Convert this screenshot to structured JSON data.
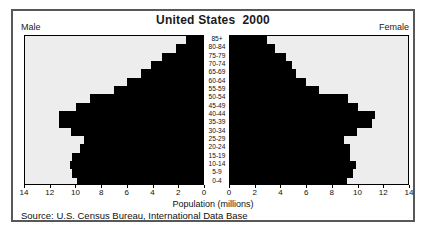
{
  "title": "United States  2000",
  "left_label": "Male",
  "right_label": "Female",
  "xlabel": "Population (millions)",
  "source": "Source: U.S. Census Bureau, International Data Base",
  "chart_data": {
    "type": "bar",
    "subtype": "population-pyramid",
    "title": "United States 2000",
    "xlabel": "Population (millions)",
    "xlim": [
      0,
      14
    ],
    "grid": false,
    "bar_color": "#000000",
    "plot_bg": "#ededed",
    "categories": [
      "85+",
      "80-84",
      "75-79",
      "70-74",
      "65-69",
      "60-64",
      "55-59",
      "50-54",
      "45-49",
      "40-44",
      "35-39",
      "30-34",
      "25-29",
      "20-24",
      "15-19",
      "10-14",
      "5-9",
      "0-4"
    ],
    "series": [
      {
        "name": "Male",
        "side": "left",
        "values": [
          1.3,
          2.1,
          3.2,
          4.1,
          4.9,
          6.0,
          7.0,
          8.9,
          10.0,
          11.3,
          11.3,
          10.4,
          9.4,
          9.7,
          10.3,
          10.5,
          10.3,
          9.9
        ]
      },
      {
        "name": "Female",
        "side": "right",
        "values": [
          2.9,
          3.5,
          4.4,
          4.9,
          5.2,
          6.0,
          7.0,
          9.3,
          10.1,
          11.4,
          11.2,
          10.0,
          9.0,
          9.4,
          9.4,
          9.9,
          9.7,
          9.2
        ]
      }
    ],
    "ticks_left": [
      14,
      12,
      10,
      8,
      6,
      4,
      2,
      0
    ],
    "ticks_right": [
      0,
      2,
      4,
      6,
      8,
      10,
      12,
      14
    ]
  }
}
